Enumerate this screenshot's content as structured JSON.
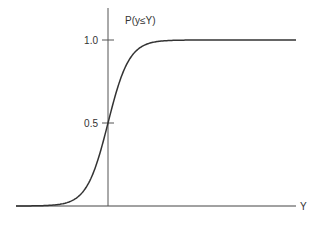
{
  "chart_data": {
    "type": "line",
    "title": "",
    "xlabel": "Y",
    "ylabel": "P(y≤Y)",
    "yticks": [
      {
        "value": 0.5,
        "label": "0.5"
      },
      {
        "value": 1.0,
        "label": "1.0"
      }
    ],
    "ylim": [
      0,
      1.2
    ],
    "grid": false,
    "legend": null,
    "series": [
      {
        "name": "cumulative distribution",
        "description": "Sigmoid CDF curve crossing 0.5 at the y-axis",
        "x": [
          -4,
          -3,
          -2,
          -1.5,
          -1,
          -0.5,
          0,
          0.5,
          1,
          1.5,
          2,
          3,
          4,
          8
        ],
        "y": [
          0.0,
          0.003,
          0.03,
          0.08,
          0.18,
          0.33,
          0.5,
          0.67,
          0.82,
          0.92,
          0.97,
          0.997,
          1.0,
          1.0
        ]
      }
    ]
  },
  "labels": {
    "y_axis": "P(y≤Y)",
    "x_axis": "Y",
    "tick_high": "1.0",
    "tick_mid": "0.5"
  }
}
